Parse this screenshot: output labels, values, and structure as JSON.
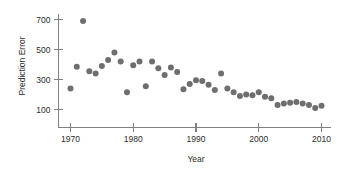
{
  "chart_data": {
    "type": "scatter",
    "title": "",
    "xlabel": "Year",
    "ylabel": "Prediction Error",
    "xlim": [
      1968,
      2011.5
    ],
    "ylim": [
      40,
      760
    ],
    "grid": false,
    "legend": null,
    "xticks": [
      1970,
      1980,
      1990,
      2000,
      2010
    ],
    "xtick_labels": [
      "1970",
      "1980",
      "1990",
      "2000",
      "2010"
    ],
    "yticks": [
      100,
      300,
      500,
      700
    ],
    "ytick_labels": [
      "100",
      "300",
      "500",
      "700"
    ],
    "marker": {
      "shape": "circle",
      "color": "#6e6e6e",
      "size": 3.0
    },
    "x": [
      1970,
      1971,
      1972,
      1973,
      1974,
      1975,
      1976,
      1977,
      1978,
      1979,
      1980,
      1981,
      1982,
      1983,
      1984,
      1985,
      1986,
      1987,
      1988,
      1989,
      1990,
      1991,
      1992,
      1993,
      1994,
      1995,
      1996,
      1997,
      1998,
      1999,
      2000,
      2001,
      2002,
      2003,
      2004,
      2005,
      2006,
      2007,
      2008,
      2009,
      2010
    ],
    "y": [
      240,
      385,
      690,
      355,
      340,
      390,
      430,
      480,
      420,
      215,
      395,
      420,
      255,
      420,
      375,
      330,
      380,
      350,
      235,
      270,
      295,
      290,
      265,
      230,
      340,
      240,
      215,
      190,
      200,
      195,
      215,
      185,
      175,
      130,
      140,
      145,
      150,
      140,
      130,
      110,
      125
    ],
    "series": [
      {
        "name": "Prediction Error",
        "points": [
          {
            "x": 1970,
            "y": 240
          },
          {
            "x": 1971,
            "y": 385
          },
          {
            "x": 1972,
            "y": 690
          },
          {
            "x": 1973,
            "y": 355
          },
          {
            "x": 1974,
            "y": 340
          },
          {
            "x": 1975,
            "y": 390
          },
          {
            "x": 1976,
            "y": 430
          },
          {
            "x": 1977,
            "y": 480
          },
          {
            "x": 1978,
            "y": 420
          },
          {
            "x": 1979,
            "y": 215
          },
          {
            "x": 1980,
            "y": 395
          },
          {
            "x": 1981,
            "y": 420
          },
          {
            "x": 1982,
            "y": 255
          },
          {
            "x": 1983,
            "y": 420
          },
          {
            "x": 1984,
            "y": 375
          },
          {
            "x": 1985,
            "y": 330
          },
          {
            "x": 1986,
            "y": 380
          },
          {
            "x": 1987,
            "y": 350
          },
          {
            "x": 1988,
            "y": 235
          },
          {
            "x": 1989,
            "y": 270
          },
          {
            "x": 1990,
            "y": 295
          },
          {
            "x": 1991,
            "y": 290
          },
          {
            "x": 1992,
            "y": 265
          },
          {
            "x": 1993,
            "y": 230
          },
          {
            "x": 1994,
            "y": 340
          },
          {
            "x": 1995,
            "y": 240
          },
          {
            "x": 1996,
            "y": 215
          },
          {
            "x": 1997,
            "y": 190
          },
          {
            "x": 1998,
            "y": 200
          },
          {
            "x": 1999,
            "y": 195
          },
          {
            "x": 2000,
            "y": 215
          },
          {
            "x": 2001,
            "y": 185
          },
          {
            "x": 2002,
            "y": 175
          },
          {
            "x": 2003,
            "y": 130
          },
          {
            "x": 2004,
            "y": 140
          },
          {
            "x": 2005,
            "y": 145
          },
          {
            "x": 2006,
            "y": 150
          },
          {
            "x": 2007,
            "y": 140
          },
          {
            "x": 2008,
            "y": 130
          },
          {
            "x": 2009,
            "y": 110
          },
          {
            "x": 2010,
            "y": 125
          }
        ]
      }
    ]
  },
  "colors": {
    "marker": "#6e6e6e",
    "axis": "#808080",
    "text": "#2b2b2b",
    "background": "#ffffff"
  }
}
